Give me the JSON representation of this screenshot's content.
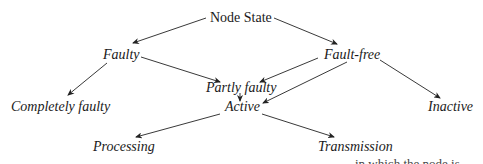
{
  "diagram": {
    "title": "Node State",
    "nodes": {
      "root": "Node State",
      "faulty": "Faulty",
      "fault_free": "Fault-free",
      "completely_faulty": "Completely faulty",
      "partly_faulty": "Partly faulty",
      "inactive": "Inactive",
      "active": "Active",
      "processing": "Processing",
      "transmission": "Transmission"
    },
    "edges": [
      [
        "Node State",
        "Faulty"
      ],
      [
        "Node State",
        "Fault-free"
      ],
      [
        "Faulty",
        "Completely faulty"
      ],
      [
        "Faulty",
        "Partly faulty"
      ],
      [
        "Fault-free",
        "Partly faulty"
      ],
      [
        "Fault-free",
        "Active"
      ],
      [
        "Fault-free",
        "Inactive"
      ],
      [
        "Partly faulty",
        "Active"
      ],
      [
        "Active",
        "Processing"
      ],
      [
        "Active",
        "Transmission"
      ]
    ]
  },
  "fragments": {
    "bottom_right": "in which the node is"
  }
}
